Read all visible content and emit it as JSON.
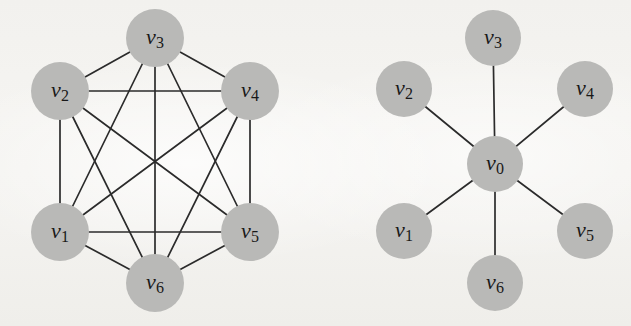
{
  "figure": {
    "width": 631,
    "height": 326,
    "background_color": "#f3f2ef",
    "node_fill_color": "#b9b9b7",
    "edge_color": "#2b2b2b",
    "label_color": "#181818"
  },
  "panels": [
    {
      "id": "complete-graph",
      "kind": "complete-graph",
      "nodes": [
        {
          "id": "v1",
          "letter": "v",
          "sub": "1",
          "cx": 60,
          "cy": 232,
          "r": 29
        },
        {
          "id": "v2",
          "letter": "v",
          "sub": "2",
          "cx": 60,
          "cy": 91,
          "r": 29
        },
        {
          "id": "v3",
          "letter": "v",
          "sub": "3",
          "cx": 155,
          "cy": 38,
          "r": 29
        },
        {
          "id": "v4",
          "letter": "v",
          "sub": "4",
          "cx": 250,
          "cy": 91,
          "r": 29
        },
        {
          "id": "v5",
          "letter": "v",
          "sub": "5",
          "cx": 250,
          "cy": 232,
          "r": 29
        },
        {
          "id": "v6",
          "letter": "v",
          "sub": "6",
          "cx": 155,
          "cy": 283,
          "r": 29
        }
      ],
      "edges": [
        [
          "v1",
          "v2"
        ],
        [
          "v1",
          "v3"
        ],
        [
          "v1",
          "v4"
        ],
        [
          "v1",
          "v5"
        ],
        [
          "v1",
          "v6"
        ],
        [
          "v2",
          "v3"
        ],
        [
          "v2",
          "v4"
        ],
        [
          "v2",
          "v5"
        ],
        [
          "v2",
          "v6"
        ],
        [
          "v3",
          "v4"
        ],
        [
          "v3",
          "v5"
        ],
        [
          "v3",
          "v6"
        ],
        [
          "v4",
          "v5"
        ],
        [
          "v4",
          "v6"
        ],
        [
          "v5",
          "v6"
        ]
      ],
      "edge_count": 15
    },
    {
      "id": "star-graph",
      "kind": "star-graph",
      "nodes": [
        {
          "id": "v0",
          "letter": "v",
          "sub": "0",
          "cx": 495,
          "cy": 164,
          "r": 28
        },
        {
          "id": "v1",
          "letter": "v",
          "sub": "1",
          "cx": 404,
          "cy": 231,
          "r": 28
        },
        {
          "id": "v2",
          "letter": "v",
          "sub": "2",
          "cx": 404,
          "cy": 89,
          "r": 28
        },
        {
          "id": "v3",
          "letter": "v",
          "sub": "3",
          "cx": 493,
          "cy": 38,
          "r": 28
        },
        {
          "id": "v4",
          "letter": "v",
          "sub": "4",
          "cx": 585,
          "cy": 89,
          "r": 28
        },
        {
          "id": "v5",
          "letter": "v",
          "sub": "5",
          "cx": 585,
          "cy": 231,
          "r": 28
        },
        {
          "id": "v6",
          "letter": "v",
          "sub": "6",
          "cx": 495,
          "cy": 283,
          "r": 28
        }
      ],
      "edges": [
        [
          "v0",
          "v1"
        ],
        [
          "v0",
          "v2"
        ],
        [
          "v0",
          "v3"
        ],
        [
          "v0",
          "v4"
        ],
        [
          "v0",
          "v5"
        ],
        [
          "v0",
          "v6"
        ]
      ],
      "edge_count": 6
    }
  ]
}
